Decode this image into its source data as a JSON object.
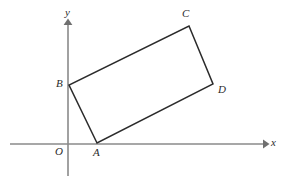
{
  "figure": {
    "background_color": "#ffffff",
    "width": 282,
    "height": 180
  },
  "axes": {
    "color": "#8a8a8a",
    "x_axis": {
      "label": "x",
      "label_x": 271,
      "label_y": 137,
      "start_x": 10,
      "end_x": 268,
      "y": 144
    },
    "y_axis": {
      "label": "y",
      "label_x": 65,
      "label_y": 7,
      "x": 68,
      "start_y": 176,
      "end_y": 20
    },
    "origin": {
      "label": "O",
      "label_x": 55,
      "label_y": 146,
      "x": 68,
      "y": 144
    }
  },
  "shape": {
    "name": "rectangle",
    "edge_color": "#2b2b2b",
    "fill": "none",
    "vertices": [
      {
        "label": "A",
        "x": 97,
        "y": 143,
        "label_x": 93,
        "label_y": 147
      },
      {
        "label": "B",
        "x": 69,
        "y": 85,
        "label_x": 56,
        "label_y": 78
      },
      {
        "label": "C",
        "x": 189,
        "y": 26,
        "label_x": 182,
        "label_y": 8
      },
      {
        "label": "D",
        "x": 213,
        "y": 84,
        "label_x": 218,
        "label_y": 84
      }
    ],
    "edge_order": [
      "A",
      "B",
      "C",
      "D"
    ],
    "path": "M 97 143 L 69 85 L 189 26 L 213 84 Z"
  }
}
